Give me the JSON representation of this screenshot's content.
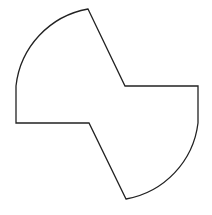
{
  "figure": {
    "stroke_color": "#222222",
    "fill_color": "#ffffff",
    "stroke_width": 1.3
  },
  "shape": {
    "path": "M 88 9 L 125 86 L 198 86 L 198 123 A 88 88 0 0 1 126 199 L 89 123 L 16 123 L 16 86 A 88 88 0 0 1 88 9 Z"
  }
}
